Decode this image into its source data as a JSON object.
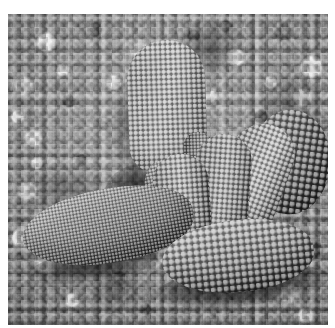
{
  "page": {
    "kind": "photograph",
    "medium": "black-and-white macro photograph",
    "width": 335,
    "height": 328,
    "background_color": "#ffffff"
  },
  "header": {
    "ghost_text": "",
    "note": "faint near-white artifact row above the photo"
  },
  "photo": {
    "caption": "",
    "alt": "Black-and-white macro photograph of a papillose succulent plant growing in coarse gravel",
    "frame": {
      "left": 8,
      "top": 14,
      "width": 320,
      "height": 311
    },
    "palette": {
      "highlight": "#f2f2f2",
      "light_grey": "#c2c2c2",
      "mid_grey": "#8a8a8a",
      "dark_grey": "#4a4a4a",
      "shadow": "#1e1e1e",
      "gravel_base": "#8f8f8f"
    },
    "subject": {
      "name": "succulent-plant",
      "description": "clump of thick papillose leaves, mesemb / living-stone type",
      "surface_texture": "dense rounded papillae (warty bumps)",
      "lighting": "directional light from upper left, deep shadow beneath leaves"
    },
    "background": {
      "name": "gravel-substrate",
      "description": "dense bed of small angular pebbles filling the whole frame",
      "tone": "mid grey with bright white highlights and black interstices"
    },
    "elements": [
      {
        "name": "leaf-back",
        "label": "tall rear leaf",
        "tone": "light grey"
      },
      {
        "name": "leaf-right-rear",
        "label": "right rear bulbous body",
        "tone": "dark grey"
      },
      {
        "name": "leaf-right-upper",
        "label": "right upper leaf",
        "tone": "bright grey"
      },
      {
        "name": "leaf-center-right",
        "label": "centre-right leaf",
        "tone": "mid grey"
      },
      {
        "name": "leaf-center",
        "label": "centre front leaf",
        "tone": "bright grey"
      },
      {
        "name": "leaf-left-small",
        "label": "small left-of-centre leaf",
        "tone": "mid grey"
      },
      {
        "name": "leaf-left-long",
        "label": "long sweeping left leaf",
        "tone": "graded light to dark"
      },
      {
        "name": "leaf-front-lower",
        "label": "large front lower leaf",
        "tone": "graded light to dark"
      },
      {
        "name": "leaf-sliver",
        "label": "narrow inner sliver leaf",
        "tone": "dark grey"
      }
    ],
    "shadows": [
      {
        "name": "shadow-core",
        "label": "deep shadow in plant core"
      },
      {
        "name": "shadow-under-left",
        "label": "cast shadow under long left leaf"
      },
      {
        "name": "shadow-under-front",
        "label": "cast shadow under front lower leaf"
      },
      {
        "name": "shadow-back-left",
        "label": "shadow left of rear leaf"
      }
    ]
  }
}
